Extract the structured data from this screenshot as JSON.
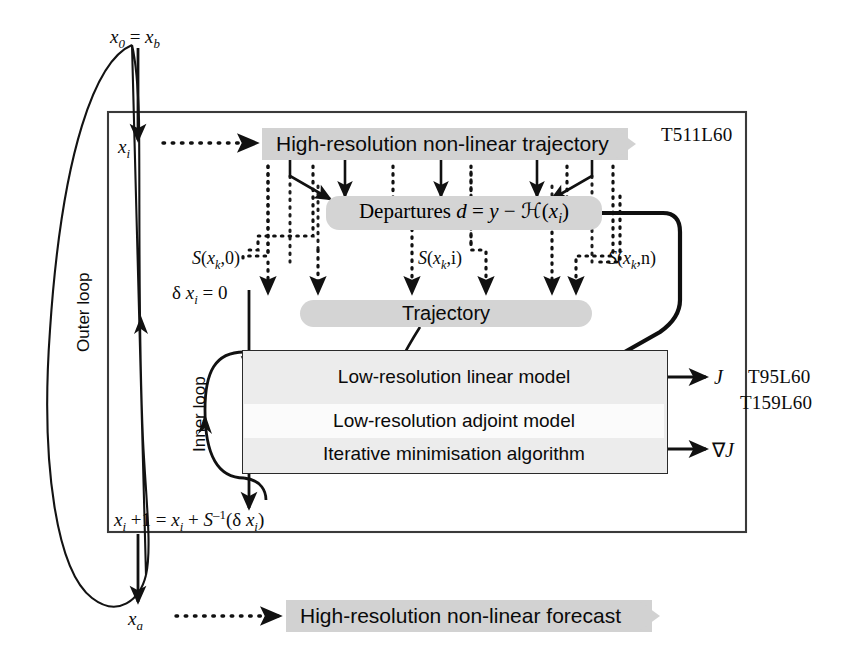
{
  "diagram": {
    "resolutions": {
      "outer": "T511L60",
      "inner_first": "T95L60",
      "inner_second": "T159L60"
    },
    "loops": {
      "outer_label": "Outer loop",
      "inner_label": "Inner loop"
    },
    "states": {
      "initial": "x0 = xb",
      "initial_html": "<i>x</i><sub>0</sub> = <i>x</i><sub>b</sub>",
      "current": "xi",
      "current_html": "<i>x</i><sub>i</sub>",
      "analysis": "xa",
      "analysis_html": "<i>x</i><sub>a</sub>",
      "increment_init": "δ xi = 0",
      "increment_init_html": "δ <i>x</i><sub>i</sub> = 0",
      "update": "xi +1 = xi + S⁻¹(δ xi)",
      "update_html": "<i>x</i><sub>i</sub> +1 = <i>x</i><sub>i</sub> + <i>S</i><sup>–1</sup>(δ <i>x</i><sub>i</sub>)"
    },
    "bands": {
      "trajectory_hi": "High-resolution non-linear trajectory",
      "forecast_hi": "High-resolution non-linear forecast"
    },
    "pills": {
      "departures": "Departures d = y − ℋ(xi)",
      "departures_html": "Departures <i>d</i> = <i>y</i> − ℋ(<i>x</i><sub>i</sub>)",
      "trajectory": "Trajectory"
    },
    "inner_box_lines": [
      "Low-resolution linear model",
      "Low-resolution adjoint model",
      "Iterative minimisation algorithm"
    ],
    "outputs": {
      "cost": "J",
      "gradient": "∇J"
    },
    "operator_labels": [
      {
        "text": "S(xk,0)",
        "html": "<i>S</i>(<i>x</i><sub>k</sub>,0)"
      },
      {
        "text": "S(xk,i)",
        "html": "<i>S</i>(<i>x</i><sub>k</sub>,i)"
      },
      {
        "text": "S(xk,n)",
        "html": "<i>S</i>(<i>x</i><sub>k</sub>,n)"
      }
    ],
    "colors": {
      "band_fill": "#d2d2d2",
      "pill_fill": "#d4d4d4",
      "inner_box_fill": "#ececec",
      "stroke": "#2a2a2a",
      "background": "#ffffff"
    }
  }
}
